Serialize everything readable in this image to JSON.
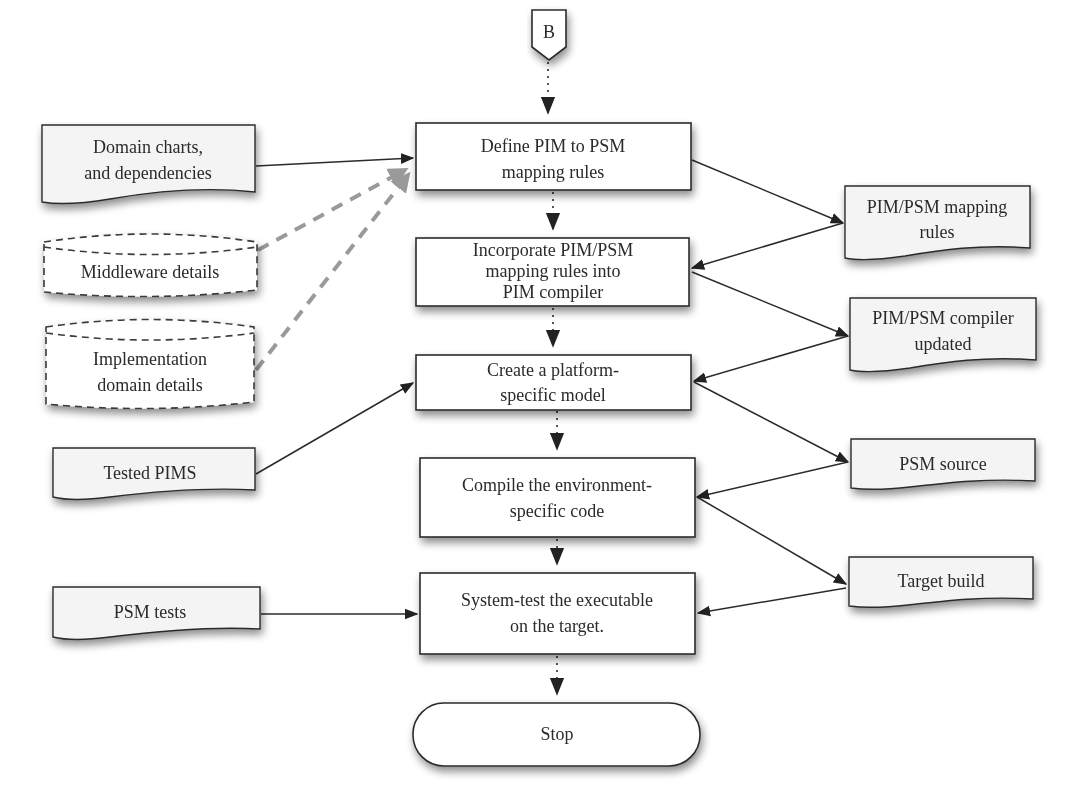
{
  "diagram": {
    "type": "flowchart",
    "connector": {
      "id": "B",
      "label": "B"
    },
    "process_steps": [
      {
        "id": "define",
        "lines": [
          "Define PIM to PSM",
          "mapping rules"
        ]
      },
      {
        "id": "incorporate",
        "lines": [
          "Incorporate PIM/PSM",
          "mapping rules into",
          "PIM compiler"
        ]
      },
      {
        "id": "create",
        "lines": [
          "Create a platform-",
          "specific model"
        ]
      },
      {
        "id": "compile",
        "lines": [
          "Compile the environment-",
          "specific code"
        ]
      },
      {
        "id": "systemtest",
        "lines": [
          "System-test the executable",
          "on the target."
        ]
      }
    ],
    "terminator": {
      "id": "stop",
      "label": "Stop"
    },
    "left_inputs": [
      {
        "id": "domain_charts",
        "shape": "document",
        "lines": [
          "Domain charts,",
          "and dependencies"
        ],
        "target": "define",
        "edge": "solid"
      },
      {
        "id": "middleware",
        "shape": "datastore-dashed",
        "lines": [
          "Middleware details"
        ],
        "target": "define",
        "edge": "gray-dashed"
      },
      {
        "id": "impl_domain",
        "shape": "datastore-dashed",
        "lines": [
          "Implementation",
          "domain details"
        ],
        "target": "define",
        "edge": "gray-dashed"
      },
      {
        "id": "tested_pims",
        "shape": "document",
        "lines": [
          "Tested PIMS"
        ],
        "target": "create",
        "edge": "solid"
      },
      {
        "id": "psm_tests",
        "shape": "document",
        "lines": [
          "PSM tests"
        ],
        "target": "systemtest",
        "edge": "solid"
      }
    ],
    "right_artifacts": [
      {
        "id": "mapping_rules",
        "shape": "document",
        "lines": [
          "PIM/PSM mapping",
          "rules"
        ],
        "from": "define",
        "to": "incorporate"
      },
      {
        "id": "compiler_updated",
        "shape": "document",
        "lines": [
          "PIM/PSM compiler",
          "updated"
        ],
        "from": "incorporate",
        "to": "create"
      },
      {
        "id": "psm_source",
        "shape": "document",
        "lines": [
          "PSM source"
        ],
        "from": "create",
        "to": "compile"
      },
      {
        "id": "target_build",
        "shape": "document",
        "lines": [
          "Target build"
        ],
        "from": "compile",
        "to": "systemtest"
      }
    ],
    "colors": {
      "stroke": "#2b2b2b",
      "document_fill": "#f4f4f4",
      "process_fill": "#ffffff",
      "dashed_edge": "#9a9a9a"
    }
  }
}
